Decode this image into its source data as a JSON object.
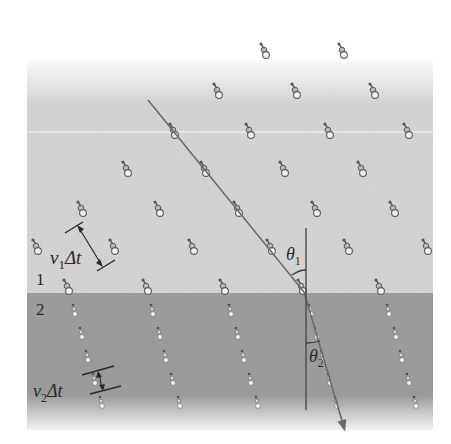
{
  "figure": {
    "colors": {
      "background": "#ffffff",
      "medium1": "#d6d6d6",
      "medium2": "#9e9e9e",
      "ray": "#6a6a6a",
      "normal": "#4a4a4a",
      "particle_dark": "#5a5a5a",
      "particle_light": "#f2f2f2",
      "annotation": "#2a2a2a"
    },
    "labels": {
      "medium1": "1",
      "medium2": "2",
      "v1": "v",
      "v1_sub": "1",
      "dt1": "Δt",
      "v2": "v",
      "v2_sub": "2",
      "dt2": "Δt",
      "theta1": "θ",
      "theta1_sub": "1",
      "theta2": "θ",
      "theta2_sub": "2"
    },
    "geometry": {
      "boundary_y": 293,
      "panel": {
        "x": 27,
        "y": 60,
        "w": 406,
        "h": 370
      },
      "ray_incident": {
        "x1": 148,
        "y1": 100,
        "x2": 304,
        "y2": 292
      },
      "ray_refracted": {
        "x1": 304,
        "y1": 292,
        "x2": 343,
        "y2": 424
      },
      "normal": {
        "x": 306,
        "y1": 228,
        "y2": 410
      }
    },
    "particles_medium1": [
      [
        265,
        52
      ],
      [
        343,
        52
      ],
      [
        218,
        92
      ],
      [
        296,
        92
      ],
      [
        374,
        92
      ],
      [
        174,
        132
      ],
      [
        250,
        132
      ],
      [
        329,
        132
      ],
      [
        408,
        132
      ],
      [
        127,
        170
      ],
      [
        205,
        170
      ],
      [
        284,
        170
      ],
      [
        362,
        170
      ],
      [
        82,
        210
      ],
      [
        159,
        210
      ],
      [
        238,
        210
      ],
      [
        316,
        210
      ],
      [
        394,
        210
      ],
      [
        37,
        248
      ],
      [
        114,
        248
      ],
      [
        193,
        248
      ],
      [
        271,
        248
      ],
      [
        348,
        248
      ],
      [
        427,
        248
      ],
      [
        68,
        288
      ],
      [
        147,
        288
      ],
      [
        224,
        288
      ],
      [
        302,
        288
      ],
      [
        380,
        288
      ]
    ],
    "particles_medium2": [
      [
        74,
        311
      ],
      [
        81,
        334
      ],
      [
        87,
        357
      ],
      [
        94,
        380
      ],
      [
        101,
        403
      ],
      [
        152,
        311
      ],
      [
        159,
        334
      ],
      [
        165,
        357
      ],
      [
        172,
        380
      ],
      [
        179,
        403
      ],
      [
        230,
        311
      ],
      [
        237,
        334
      ],
      [
        243,
        357
      ],
      [
        250,
        380
      ],
      [
        257,
        403
      ],
      [
        310,
        311
      ],
      [
        316,
        334
      ],
      [
        322,
        357
      ],
      [
        329,
        380
      ],
      [
        336,
        403
      ],
      [
        388,
        311
      ],
      [
        395,
        334
      ],
      [
        401,
        357
      ],
      [
        408,
        380
      ],
      [
        415,
        403
      ]
    ]
  }
}
